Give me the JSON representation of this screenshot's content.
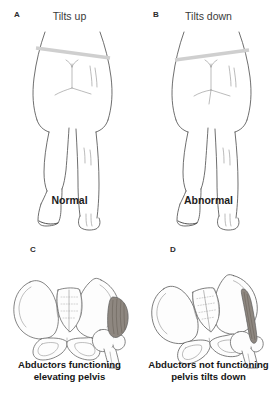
{
  "figure": {
    "background_color": "#ffffff",
    "line_color": "#4a4a4a",
    "band_color": "#cfcfcf",
    "muscle_color": "#8e8780"
  },
  "panels": [
    {
      "letter": "A",
      "header": "Tilts up",
      "caption": "Normal",
      "view": "posterior-standing-on-one-leg",
      "pelvis_band_direction": "up-on-unsupported-side"
    },
    {
      "letter": "B",
      "header": "Tilts down",
      "caption": "Abnormal",
      "view": "posterior-standing-on-one-leg",
      "pelvis_band_direction": "down-on-unsupported-side"
    },
    {
      "letter": "C",
      "caption_line1": "Abductors functioning",
      "caption_line2": "elevating pelvis",
      "view": "pelvis-anterior",
      "muscle_state": "contracted-bulging"
    },
    {
      "letter": "D",
      "caption_line1": "Abductors not functioning",
      "caption_line2": "pelvis tilts down",
      "view": "pelvis-anterior-tilted",
      "muscle_state": "thin-elongated"
    }
  ]
}
